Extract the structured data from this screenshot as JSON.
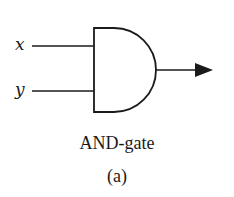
{
  "diagram": {
    "type": "logic-gate",
    "gate": "AND",
    "inputs": [
      {
        "label": "x"
      },
      {
        "label": "y"
      }
    ],
    "output": {
      "direction": "right",
      "arrow": true
    },
    "caption": "AND-gate",
    "sublabel": "(a)",
    "colors": {
      "stroke": "#1a1a1a",
      "background": "#ffffff"
    }
  }
}
